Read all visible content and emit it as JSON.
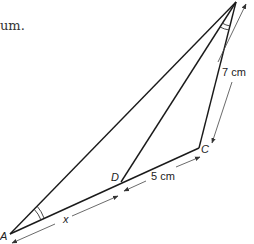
{
  "text_fragment": "um.",
  "diagram": {
    "vertices": {
      "A": {
        "label": "A",
        "x": 10,
        "y": 234
      },
      "B": {
        "label": "",
        "x": 236,
        "y": 2
      },
      "C": {
        "label": "C",
        "x": 199,
        "y": 148
      },
      "D": {
        "label": "D",
        "x": 121,
        "y": 182
      }
    },
    "measures": {
      "AD": "x",
      "DC": "5 cm",
      "BC": "7 cm"
    },
    "stroke_color": "#1a1a1a",
    "dim_color": "#444444"
  }
}
